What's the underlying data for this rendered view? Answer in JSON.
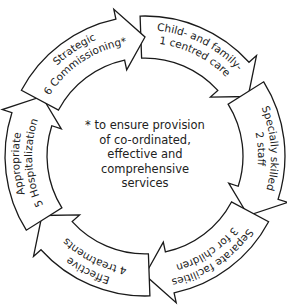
{
  "diagram": {
    "type": "cycle",
    "center_note": [
      "* to ensure provision",
      "of co-ordinated,",
      "effective and",
      "comprehensive",
      "services"
    ],
    "segments": [
      {
        "number": "1",
        "lines": [
          "Child- and family-",
          "centred care"
        ]
      },
      {
        "number": "2",
        "lines": [
          "Specially skilled",
          "staff"
        ]
      },
      {
        "number": "3",
        "lines": [
          "Separate facilities",
          "for children"
        ]
      },
      {
        "number": "4",
        "lines": [
          "Effective",
          "treatments"
        ]
      },
      {
        "number": "5",
        "lines": [
          "Appropriate",
          "Hospitalization"
        ]
      },
      {
        "number": "6",
        "lines": [
          "Strategic",
          "Commissioning*"
        ]
      }
    ],
    "colors": {
      "stroke": "#1a1a1a",
      "fill": "#ffffff",
      "text": "#222222"
    }
  }
}
